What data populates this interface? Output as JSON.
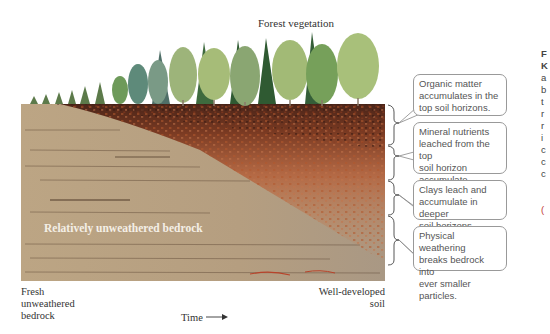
{
  "diagram": {
    "title": "Forest vegetation",
    "bedrock_label": "Relatively unweathered bedrock",
    "axis": {
      "left_label_lines": [
        "Fresh",
        "unweathered",
        "bedrock"
      ],
      "right_label_lines": [
        "Well-developed",
        "soil"
      ],
      "time_label": "Time",
      "time_arrow": "→"
    },
    "callouts": [
      {
        "lines": [
          "Organic matter",
          "accumulates in the",
          "top soil horizons."
        ]
      },
      {
        "lines": [
          "Mineral nutrients",
          "leached from the top",
          "soil horizon accumulate",
          "in the next soil horizon."
        ]
      },
      {
        "lines": [
          "Clays leach and",
          "accumulate in deeper",
          "soil horizons."
        ]
      },
      {
        "lines": [
          "Physical weathering",
          "breaks bedrock into",
          "ever smaller particles."
        ]
      }
    ],
    "right_edge_cut_text": [
      "F",
      "K",
      "a",
      "b",
      "t",
      "r",
      "r",
      "i",
      "c",
      "c",
      "c",
      "("
    ],
    "colors": {
      "bedrock": "#b8a080",
      "bedrock_light": "#c4ae8e",
      "organic": "#4a2418",
      "mineral": "#a0502a",
      "clay": "#c07048",
      "tree_dark": "#2f5a32",
      "tree_mid": "#6e9a5a",
      "tree_light": "#a8c07a",
      "tree_blue": "#6d8f84",
      "callout_border": "#999999"
    }
  }
}
